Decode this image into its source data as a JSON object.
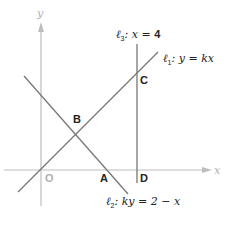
{
  "diagram": {
    "axes": {
      "x_label": "x",
      "y_label": "y",
      "origin_label": "O",
      "color": "#b8b8b8"
    },
    "points": {
      "A": "A",
      "B": "B",
      "C": "C",
      "D": "D"
    },
    "lines": [
      {
        "id": "l1",
        "name": "ℓ",
        "sub": "1",
        "equation": ": y = kx"
      },
      {
        "id": "l2",
        "name": "ℓ",
        "sub": "2",
        "equation": ": ky = 2 − x"
      },
      {
        "id": "l3",
        "name": "ℓ",
        "sub": "3",
        "equation_prefix": ": x = ",
        "equation_value": "4"
      }
    ],
    "line_color": "#777777"
  }
}
